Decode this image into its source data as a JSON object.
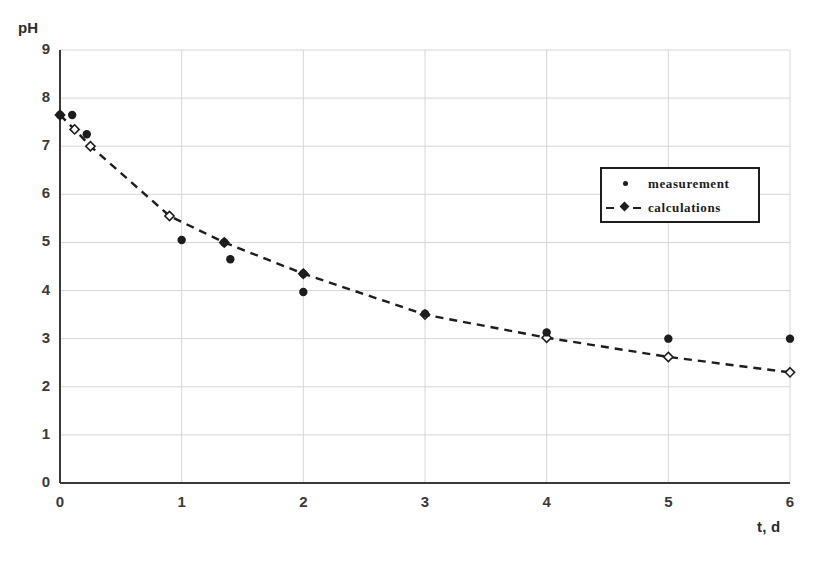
{
  "chart_data": {
    "type": "scatter",
    "title": "",
    "xlabel": "t, d",
    "ylabel": "pH",
    "xlim": [
      0,
      6
    ],
    "ylim": [
      0,
      9
    ],
    "grid": true,
    "legend_position": "upper-right-inside",
    "xticks": [
      "0",
      "1",
      "2",
      "3",
      "4",
      "5",
      "6"
    ],
    "yticks": [
      "0",
      "1",
      "2",
      "3",
      "4",
      "5",
      "6",
      "7",
      "8",
      "9"
    ],
    "series": [
      {
        "name": "measurement",
        "marker": "filled-circle",
        "line": "none",
        "color": "#1d1d1d",
        "points": [
          {
            "x": 0.0,
            "y": 7.65
          },
          {
            "x": 0.1,
            "y": 7.65
          },
          {
            "x": 0.22,
            "y": 7.25
          },
          {
            "x": 1.0,
            "y": 5.05
          },
          {
            "x": 1.35,
            "y": 5.0
          },
          {
            "x": 1.4,
            "y": 4.65
          },
          {
            "x": 2.0,
            "y": 4.35
          },
          {
            "x": 2.0,
            "y": 3.97
          },
          {
            "x": 3.0,
            "y": 3.52
          },
          {
            "x": 4.0,
            "y": 3.13
          },
          {
            "x": 5.0,
            "y": 3.0
          },
          {
            "x": 6.0,
            "y": 3.0
          }
        ]
      },
      {
        "name": "calculations",
        "marker": "open-diamond",
        "line": "dashed",
        "color": "#1d1d1d",
        "points": [
          {
            "x": 0.0,
            "y": 7.65
          },
          {
            "x": 0.12,
            "y": 7.35
          },
          {
            "x": 0.25,
            "y": 7.0
          },
          {
            "x": 0.9,
            "y": 5.55
          },
          {
            "x": 1.35,
            "y": 5.0
          },
          {
            "x": 2.0,
            "y": 4.35
          },
          {
            "x": 3.0,
            "y": 3.5
          },
          {
            "x": 4.0,
            "y": 3.02
          },
          {
            "x": 5.0,
            "y": 2.62
          },
          {
            "x": 6.0,
            "y": 2.3
          }
        ]
      }
    ]
  },
  "legend": {
    "measurement_label": "measurement",
    "calculations_label": "calculations"
  },
  "colors": {
    "ink": "#1d1d1d",
    "grid": "#d6d6d6",
    "axis": "#3a3a3a"
  }
}
